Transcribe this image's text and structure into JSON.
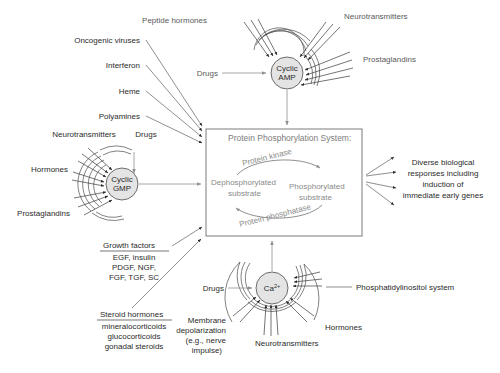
{
  "diagram": {
    "background_color": "#ffffff",
    "line_color": "#4a4a4a",
    "gray_text_color": "#8a8a8a",
    "dark_text_color": "#2b2b2b",
    "cell_fill_color": "#e4e4e4"
  },
  "central_box": {
    "title": "Protein Phosphorylation System:",
    "left_node": "Dephosphorylated substrate",
    "left_node_line1": "Dephosphorylated",
    "left_node_line2": "substrate",
    "right_node": "Phosphorylated substrate",
    "right_node_line1": "Phosphorylated",
    "right_node_line2": "substrate",
    "forward_enzyme": "Protein kinase",
    "reverse_enzyme": "Protein phosphatase"
  },
  "second_messengers": [
    {
      "name": "cyclic-amp",
      "line1": "Cyclic",
      "line2": "AMP"
    },
    {
      "name": "cyclic-gmp",
      "line1": "Cyclic",
      "line2": "GMP"
    },
    {
      "name": "calcium",
      "line1": "Ca",
      "superscript": "2+"
    }
  ],
  "camp_inputs": {
    "peptide_hormones": "Peptide hormones",
    "neurotransmitters": "Neurotransmitters",
    "prostaglandins": "Prostaglandins",
    "drugs": "Drugs"
  },
  "cgmp_inputs": {
    "neurotransmitters": "Neurotransmitters",
    "drugs": "Drugs",
    "hormones": "Hormones",
    "prostaglandins": "Prostaglandins"
  },
  "calcium_inputs": {
    "drugs": "Drugs",
    "phosphatidylinositol": "Phosphatidylinositol system",
    "hormones": "Hormones",
    "neurotransmitters": "Neurotransmitters",
    "membrane_depolarization_line1": "Membrane",
    "membrane_depolarization_line2": "depolarization",
    "membrane_depolarization_line3": "(e.g., nerve",
    "membrane_depolarization_line4": "impulse)"
  },
  "direct_inputs": [
    {
      "label": "Oncogenic viruses"
    },
    {
      "label": "Interferon"
    },
    {
      "label": "Heme"
    },
    {
      "label": "Polyamines"
    }
  ],
  "growth_factors_box": {
    "header": "Growth factors",
    "lines": [
      "EGF, insulin",
      "PDGF, NGF,",
      "FGF, TGF, SC"
    ]
  },
  "steroid_hormones_box": {
    "header": "Steroid hormones",
    "lines": [
      "mineralocorticoids",
      "glucocorticoids",
      "gonadal steroids"
    ]
  },
  "output": {
    "lines": [
      "Diverse biological",
      "responses including",
      "induction of",
      "immediate early genes"
    ],
    "full": "Diverse biological responses including induction of immediate early genes"
  }
}
